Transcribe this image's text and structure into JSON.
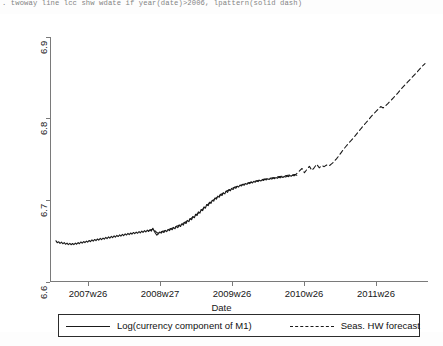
{
  "console": {
    "command": ". twoway line lcc shw wdate if year(date)>2006, lpattern(solid dash)"
  },
  "chart_data": {
    "type": "line",
    "title": "",
    "xlabel": "Date",
    "ylabel": "",
    "ylim": [
      6.555,
      6.915
    ],
    "yticks": [
      "6.6",
      "6.7",
      "6.8",
      "6.9"
    ],
    "ytick_values": [
      6.6,
      6.7,
      6.8,
      6.9
    ],
    "xticks": [
      "2007w26",
      "2008w27",
      "2009w26",
      "2010w26",
      "2011w26"
    ],
    "xtick_positions": [
      88,
      160,
      232,
      304,
      376
    ],
    "xlim_label_range": [
      "2007w01",
      "2012w10"
    ],
    "grid": false,
    "legend_position": "bottom",
    "series": [
      {
        "name": "Log(currency component of M1)",
        "style": "solid",
        "color": "#1a1a1a",
        "points": [
          [
            0.0,
            6.6155
          ],
          [
            0.004,
            6.6128
          ],
          [
            0.009,
            6.6142
          ],
          [
            0.013,
            6.6118
          ],
          [
            0.018,
            6.6135
          ],
          [
            0.022,
            6.6112
          ],
          [
            0.027,
            6.6128
          ],
          [
            0.031,
            6.6105
          ],
          [
            0.036,
            6.6122
          ],
          [
            0.04,
            6.61
          ],
          [
            0.045,
            6.6118
          ],
          [
            0.049,
            6.6098
          ],
          [
            0.054,
            6.6116
          ],
          [
            0.058,
            6.61
          ],
          [
            0.063,
            6.6122
          ],
          [
            0.067,
            6.6105
          ],
          [
            0.072,
            6.613
          ],
          [
            0.076,
            6.6112
          ],
          [
            0.081,
            6.6138
          ],
          [
            0.085,
            6.612
          ],
          [
            0.09,
            6.6145
          ],
          [
            0.094,
            6.6128
          ],
          [
            0.099,
            6.6152
          ],
          [
            0.103,
            6.6135
          ],
          [
            0.108,
            6.616
          ],
          [
            0.112,
            6.6142
          ],
          [
            0.117,
            6.6168
          ],
          [
            0.121,
            6.615
          ],
          [
            0.126,
            6.6175
          ],
          [
            0.13,
            6.6158
          ],
          [
            0.135,
            6.6182
          ],
          [
            0.139,
            6.6165
          ],
          [
            0.144,
            6.619
          ],
          [
            0.148,
            6.6172
          ],
          [
            0.153,
            6.6196
          ],
          [
            0.157,
            6.618
          ],
          [
            0.162,
            6.6205
          ],
          [
            0.166,
            6.6188
          ],
          [
            0.171,
            6.6212
          ],
          [
            0.175,
            6.6195
          ],
          [
            0.18,
            6.622
          ],
          [
            0.184,
            6.6202
          ],
          [
            0.189,
            6.6228
          ],
          [
            0.193,
            6.621
          ],
          [
            0.198,
            6.6235
          ],
          [
            0.202,
            6.6218
          ],
          [
            0.207,
            6.6242
          ],
          [
            0.211,
            6.6225
          ],
          [
            0.216,
            6.625
          ],
          [
            0.22,
            6.6232
          ],
          [
            0.225,
            6.6256
          ],
          [
            0.229,
            6.624
          ],
          [
            0.234,
            6.6265
          ],
          [
            0.238,
            6.6246
          ],
          [
            0.243,
            6.627
          ],
          [
            0.247,
            6.6252
          ],
          [
            0.252,
            6.6278
          ],
          [
            0.256,
            6.626
          ],
          [
            0.261,
            6.6284
          ],
          [
            0.265,
            6.6266
          ],
          [
            0.27,
            6.6292
          ],
          [
            0.274,
            6.6272
          ],
          [
            0.279,
            6.6298
          ],
          [
            0.283,
            6.6278
          ],
          [
            0.288,
            6.6305
          ],
          [
            0.292,
            6.6285
          ],
          [
            0.297,
            6.6312
          ],
          [
            0.301,
            6.6292
          ],
          [
            0.306,
            6.6318
          ],
          [
            0.31,
            6.6298
          ],
          [
            0.315,
            6.634
          ],
          [
            0.319,
            6.63
          ],
          [
            0.324,
            6.6262
          ],
          [
            0.328,
            6.6238
          ],
          [
            0.333,
            6.6258
          ],
          [
            0.337,
            6.6285
          ],
          [
            0.342,
            6.6268
          ],
          [
            0.346,
            6.6295
          ],
          [
            0.351,
            6.6278
          ],
          [
            0.355,
            6.6308
          ],
          [
            0.36,
            6.629
          ],
          [
            0.364,
            6.6322
          ],
          [
            0.369,
            6.6305
          ],
          [
            0.373,
            6.6336
          ],
          [
            0.378,
            6.6318
          ],
          [
            0.382,
            6.6352
          ],
          [
            0.387,
            6.6332
          ],
          [
            0.391,
            6.6368
          ],
          [
            0.396,
            6.6348
          ],
          [
            0.4,
            6.6385
          ],
          [
            0.405,
            6.6365
          ],
          [
            0.409,
            6.6405
          ],
          [
            0.414,
            6.6386
          ],
          [
            0.418,
            6.6428
          ],
          [
            0.423,
            6.641
          ],
          [
            0.427,
            6.6455
          ],
          [
            0.432,
            6.6436
          ],
          [
            0.436,
            6.6482
          ],
          [
            0.441,
            6.6465
          ],
          [
            0.445,
            6.6512
          ],
          [
            0.45,
            6.6495
          ],
          [
            0.454,
            6.6545
          ],
          [
            0.459,
            6.6528
          ],
          [
            0.463,
            6.658
          ],
          [
            0.468,
            6.6562
          ],
          [
            0.472,
            6.6615
          ],
          [
            0.477,
            6.6598
          ],
          [
            0.481,
            6.6652
          ],
          [
            0.486,
            6.6635
          ],
          [
            0.49,
            6.6688
          ],
          [
            0.495,
            6.6672
          ],
          [
            0.499,
            6.6722
          ],
          [
            0.504,
            6.6705
          ],
          [
            0.508,
            6.6752
          ],
          [
            0.513,
            6.6738
          ],
          [
            0.517,
            6.6785
          ],
          [
            0.522,
            6.6768
          ],
          [
            0.526,
            6.6812
          ],
          [
            0.531,
            6.6796
          ],
          [
            0.535,
            6.6838
          ],
          [
            0.54,
            6.6822
          ],
          [
            0.544,
            6.6862
          ],
          [
            0.549,
            6.6845
          ],
          [
            0.553,
            6.6885
          ],
          [
            0.558,
            6.6868
          ],
          [
            0.562,
            6.6905
          ],
          [
            0.567,
            6.689
          ],
          [
            0.571,
            6.6925
          ],
          [
            0.576,
            6.691
          ],
          [
            0.58,
            6.6942
          ],
          [
            0.585,
            6.6928
          ],
          [
            0.589,
            6.6958
          ],
          [
            0.594,
            6.6945
          ],
          [
            0.598,
            6.6972
          ],
          [
            0.603,
            6.696
          ],
          [
            0.607,
            6.6985
          ],
          [
            0.612,
            6.6972
          ],
          [
            0.616,
            6.6996
          ],
          [
            0.621,
            6.6985
          ],
          [
            0.625,
            6.7008
          ],
          [
            0.63,
            6.6996
          ],
          [
            0.634,
            6.7018
          ],
          [
            0.639,
            6.7006
          ],
          [
            0.643,
            6.7028
          ],
          [
            0.648,
            6.7016
          ],
          [
            0.652,
            6.7036
          ],
          [
            0.657,
            6.7025
          ],
          [
            0.661,
            6.7045
          ],
          [
            0.666,
            6.7034
          ],
          [
            0.67,
            6.7052
          ],
          [
            0.675,
            6.7042
          ],
          [
            0.679,
            6.706
          ],
          [
            0.684,
            6.705
          ],
          [
            0.688,
            6.7066
          ],
          [
            0.693,
            6.7056
          ],
          [
            0.697,
            6.7072
          ],
          [
            0.702,
            6.7062
          ],
          [
            0.706,
            6.7078
          ],
          [
            0.711,
            6.7068
          ],
          [
            0.715,
            6.7084
          ],
          [
            0.72,
            6.7074
          ],
          [
            0.724,
            6.709
          ],
          [
            0.729,
            6.708
          ],
          [
            0.733,
            6.7096
          ],
          [
            0.738,
            6.7086
          ],
          [
            0.742,
            6.7102
          ],
          [
            0.747,
            6.7092
          ],
          [
            0.751,
            6.7108
          ],
          [
            0.756,
            6.7098
          ],
          [
            0.76,
            6.7114
          ],
          [
            0.765,
            6.7104
          ],
          [
            0.769,
            6.712
          ],
          [
            0.774,
            6.711
          ],
          [
            0.778,
            6.7126
          ],
          [
            0.783,
            6.7118
          ]
        ]
      },
      {
        "name": "Seas. HW forecast",
        "style": "dashed",
        "color": "#1a1a1a",
        "points": [
          [
            0.3,
            6.6298
          ],
          [
            0.315,
            6.633
          ],
          [
            0.33,
            6.6268
          ],
          [
            0.345,
            6.629
          ],
          [
            0.36,
            6.631
          ],
          [
            0.375,
            6.6335
          ],
          [
            0.39,
            6.6365
          ],
          [
            0.405,
            6.6392
          ],
          [
            0.42,
            6.6428
          ],
          [
            0.435,
            6.647
          ],
          [
            0.45,
            6.6518
          ],
          [
            0.465,
            6.6572
          ],
          [
            0.48,
            6.6632
          ],
          [
            0.495,
            6.6692
          ],
          [
            0.51,
            6.6748
          ],
          [
            0.525,
            6.68
          ],
          [
            0.54,
            6.6846
          ],
          [
            0.555,
            6.6886
          ],
          [
            0.57,
            6.692
          ],
          [
            0.585,
            6.6948
          ],
          [
            0.6,
            6.6972
          ],
          [
            0.615,
            6.6992
          ],
          [
            0.63,
            6.701
          ],
          [
            0.645,
            6.7028
          ],
          [
            0.66,
            6.7044
          ],
          [
            0.675,
            6.7058
          ],
          [
            0.69,
            6.707
          ],
          [
            0.705,
            6.7082
          ],
          [
            0.72,
            6.7094
          ],
          [
            0.735,
            6.7104
          ],
          [
            0.75,
            6.7114
          ],
          [
            0.765,
            6.7124
          ],
          [
            0.78,
            6.7132
          ],
          [
            0.79,
            6.7175
          ],
          [
            0.8,
            6.7218
          ],
          [
            0.808,
            6.7155
          ],
          [
            0.816,
            6.7205
          ],
          [
            0.824,
            6.725
          ],
          [
            0.832,
            6.719
          ],
          [
            0.84,
            6.7232
          ],
          [
            0.848,
            6.728
          ],
          [
            0.856,
            6.7228
          ],
          [
            0.864,
            6.7262
          ],
          [
            0.872,
            6.7245
          ],
          [
            0.88,
            6.7268
          ],
          [
            0.888,
            6.7255
          ],
          [
            0.896,
            6.7285
          ],
          [
            0.904,
            6.7318
          ],
          [
            0.912,
            6.736
          ],
          [
            0.92,
            6.7405
          ],
          [
            0.928,
            6.7455
          ],
          [
            0.936,
            6.7505
          ],
          [
            0.944,
            6.7548
          ],
          [
            0.952,
            6.7592
          ],
          [
            0.96,
            6.763
          ],
          [
            0.968,
            6.7672
          ],
          [
            0.976,
            6.7715
          ],
          [
            0.984,
            6.776
          ],
          [
            0.992,
            6.7805
          ],
          [
            1.0,
            6.7848
          ],
          [
            1.008,
            6.789
          ],
          [
            1.016,
            6.7932
          ],
          [
            1.024,
            6.7975
          ],
          [
            1.032,
            6.8016
          ],
          [
            1.04,
            6.8052
          ],
          [
            1.048,
            6.809
          ],
          [
            1.056,
            6.8128
          ],
          [
            1.064,
            6.8108
          ],
          [
            1.072,
            6.814
          ],
          [
            1.08,
            6.8175
          ],
          [
            1.088,
            6.8212
          ],
          [
            1.096,
            6.825
          ],
          [
            1.104,
            6.829
          ],
          [
            1.112,
            6.833
          ],
          [
            1.12,
            6.8372
          ],
          [
            1.128,
            6.8412
          ],
          [
            1.136,
            6.8452
          ],
          [
            1.144,
            6.849
          ],
          [
            1.152,
            6.8528
          ],
          [
            1.16,
            6.8566
          ],
          [
            1.168,
            6.8605
          ],
          [
            1.176,
            6.8645
          ],
          [
            1.184,
            6.8685
          ],
          [
            1.192,
            6.8725
          ],
          [
            1.2,
            6.876
          ]
        ]
      }
    ]
  }
}
